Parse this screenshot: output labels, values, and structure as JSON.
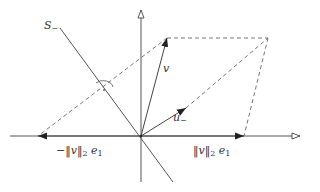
{
  "diagram": {
    "colors": {
      "line": "#555555",
      "dashed": "#666666",
      "text": "#333333",
      "background": "#ffffff"
    },
    "origin": [
      141,
      136
    ],
    "axes": {
      "horizontal": {
        "from": [
          10,
          136
        ],
        "to": [
          300,
          136
        ],
        "arrow": "open"
      },
      "vertical": {
        "from": [
          141,
          182
        ],
        "to": [
          141,
          10
        ],
        "arrow": "open"
      }
    },
    "vectors": [
      {
        "name": "v",
        "from": [
          141,
          136
        ],
        "to": [
          167,
          38
        ]
      },
      {
        "name": "u_-",
        "from": [
          141,
          136
        ],
        "to": [
          186,
          108
        ]
      },
      {
        "name": "norm-v-e1",
        "from": [
          141,
          136
        ],
        "to": [
          244,
          136
        ]
      },
      {
        "name": "neg-norm-v-e1",
        "from": [
          141,
          136
        ],
        "to": [
          38,
          136
        ]
      }
    ],
    "dashed_lines": [
      {
        "from": [
          167,
          38
        ],
        "to": [
          268,
          38
        ]
      },
      {
        "from": [
          268,
          38
        ],
        "to": [
          244,
          136
        ]
      },
      {
        "from": [
          167,
          38
        ],
        "to": [
          38,
          136
        ]
      },
      {
        "from": [
          186,
          108
        ],
        "to": [
          268,
          38
        ]
      }
    ],
    "hyperplane_line": {
      "from": [
        60,
        28
      ],
      "to": [
        173,
        182
      ]
    },
    "angle_marker": {
      "center": [
        103,
        86
      ],
      "radius": 10
    },
    "labels": {
      "s_minus": {
        "base": "S",
        "sub": "−"
      },
      "v": "v",
      "u_minus": {
        "base": "u",
        "sub": "−"
      },
      "pos_e1": {
        "text": "‖v‖",
        "sub": "2",
        "suffix": " e",
        "suffix_sub": "1"
      },
      "neg_e1": {
        "prefix": "−",
        "text": "‖v‖",
        "sub": "2",
        "suffix": " e",
        "suffix_sub": "1"
      }
    }
  }
}
